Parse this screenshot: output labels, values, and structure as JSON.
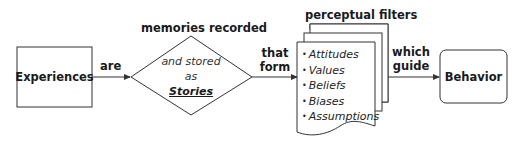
{
  "nodes": {
    "experiences": {
      "label": "Experiences"
    },
    "stories": {
      "title": "memories recorded",
      "line1": "and stored",
      "line2": "as",
      "line3": "Stories"
    },
    "filters": {
      "title": "perceptual filters",
      "items": [
        "Attitudes",
        "Values",
        "Beliefs",
        "Biases",
        "Assumptions"
      ]
    },
    "behavior": {
      "label": "Behavior"
    }
  },
  "edges": {
    "experiences_to_stories": {
      "label": "are"
    },
    "stories_to_filters": {
      "line1": "that",
      "line2": "form"
    },
    "filters_to_behavior": {
      "line1": "which",
      "line2": "guide"
    }
  },
  "colors": {
    "stroke": "#333333",
    "text": "#1a1a1a",
    "background": "#ffffff"
  }
}
